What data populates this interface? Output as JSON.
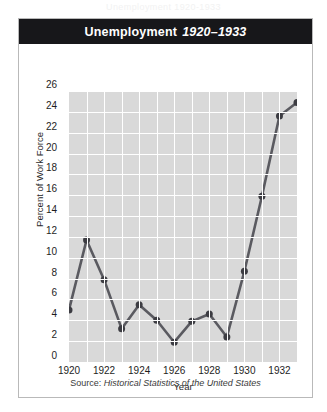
{
  "ghost_text": "Unemployment 1920-1933",
  "figure": {
    "title_main": "Unemployment",
    "title_years": "1920–1933",
    "source_prefix": "Source:",
    "source_title": "Historical Statistics of the United States"
  },
  "colors": {
    "title_bar": "#17171a",
    "plot_background": "#d9d9d9",
    "grid": "#ffffff",
    "series_line": "#5a5a60",
    "marker": "#3c3c42",
    "frame_border": "#b9b9b9",
    "text": "#1e1e1e"
  },
  "chart_data": {
    "type": "line",
    "title": "Unemployment 1920–1933",
    "xlabel": "Year",
    "ylabel": "Percent of Work Force",
    "xlim": [
      1920,
      1933
    ],
    "ylim": [
      0,
      26
    ],
    "ytick_step": 2,
    "xtick_step": 2,
    "grid": true,
    "legend": "none",
    "yticks": [
      0,
      2,
      4,
      6,
      8,
      10,
      12,
      14,
      16,
      18,
      20,
      22,
      24,
      26
    ],
    "xticks": [
      1920,
      1922,
      1924,
      1926,
      1928,
      1930,
      1932
    ],
    "x": [
      1920,
      1921,
      1922,
      1923,
      1924,
      1925,
      1926,
      1927,
      1928,
      1929,
      1930,
      1931,
      1932,
      1933
    ],
    "values": [
      5.0,
      11.7,
      7.9,
      3.2,
      5.5,
      4.0,
      1.9,
      3.9,
      4.6,
      2.4,
      8.7,
      15.9,
      23.6,
      24.9
    ],
    "source": "Source: Historical Statistics of the United States"
  }
}
